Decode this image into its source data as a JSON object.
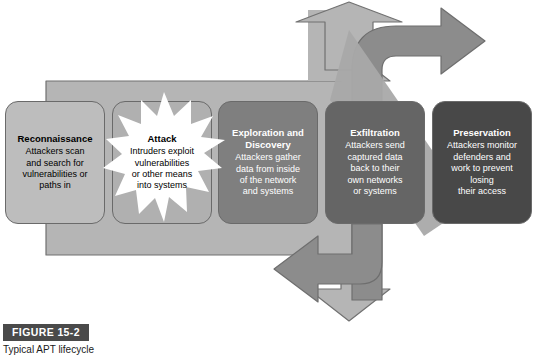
{
  "figure": {
    "label": "FIGURE 15-2",
    "caption": "Typical APT lifecycle",
    "label_bg": "#4a4a4a",
    "page_bg": "#ffffff"
  },
  "diagram": {
    "name": "apt-lifecycle-flow",
    "band_color": "#c2c2c2",
    "arrow_light_color": "#b5b5b5",
    "arrow_dark_color": "#8c8c8c",
    "arrow_outline_color": "#6e6e6e",
    "stages": [
      {
        "id": "reconnaissance",
        "title": "Reconnaissance",
        "description": "Attackers scan\nand search for\nvulnerabilities or\npaths in",
        "fill": "#bdbdbd",
        "text_color": "#000000",
        "has_burst": false
      },
      {
        "id": "attack",
        "title": "Attack",
        "description": "Intruders exploit\nvulnerabilities\nor other means\ninto systems",
        "fill": "#b0b0b0",
        "text_color": "#000000",
        "has_burst": true,
        "burst_color": "#ffffff"
      },
      {
        "id": "exploration-and-discovery",
        "title": "Exploration and\nDiscovery",
        "description": "Attackers gather\ndata from inside\nof the network\nand systems",
        "fill": "#7f7f7f",
        "text_color": "#ffffff",
        "has_burst": false
      },
      {
        "id": "exfiltration",
        "title": "Exfiltration",
        "description": "Attackers send\ncaptured data\nback to their\nown networks\nor systems",
        "fill": "#656565",
        "text_color": "#ffffff",
        "has_burst": false
      },
      {
        "id": "preservation",
        "title": "Preservation",
        "description": "Attackers monitor\ndefenders and\nwork to prevent\nlosing\ntheir access",
        "fill": "#484848",
        "text_color": "#ffffff",
        "has_burst": false
      }
    ]
  }
}
